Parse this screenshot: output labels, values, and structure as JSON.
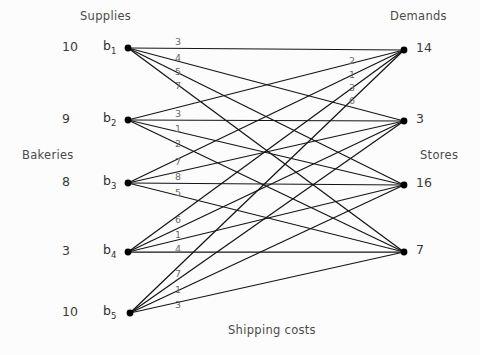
{
  "labels": {
    "supplies": "Supplies",
    "demands": "Demands",
    "bakeries": "Bakeries",
    "stores": "Stores",
    "caption": "Shipping costs"
  },
  "bakeries": [
    {
      "name": "b",
      "index": "1",
      "supply": "10",
      "x": 128,
      "y": 48
    },
    {
      "name": "b",
      "index": "2",
      "supply": "9",
      "x": 128,
      "y": 120
    },
    {
      "name": "b",
      "index": "3",
      "supply": "8",
      "x": 128,
      "y": 183
    },
    {
      "name": "b",
      "index": "4",
      "supply": "3",
      "x": 128,
      "y": 252
    },
    {
      "name": "b",
      "index": "5",
      "supply": "10",
      "x": 130,
      "y": 313
    }
  ],
  "stores": [
    {
      "demand": "14",
      "x": 404,
      "y": 50
    },
    {
      "demand": "3",
      "x": 404,
      "y": 121
    },
    {
      "demand": "16",
      "x": 404,
      "y": 185
    },
    {
      "demand": "7",
      "x": 404,
      "y": 252
    }
  ],
  "chart_data": {
    "type": "diagram",
    "title": "Shipping costs",
    "subtype": "bipartite-transportation-network",
    "left_axis_label": "Bakeries",
    "right_axis_label": "Stores",
    "left_value_header": "Supplies",
    "right_value_header": "Demands",
    "left_nodes": [
      "b1",
      "b2",
      "b3",
      "b4",
      "b5"
    ],
    "right_nodes": [
      "s1",
      "s2",
      "s3",
      "s4"
    ],
    "supplies": [
      10,
      9,
      8,
      3,
      10
    ],
    "demands": [
      14,
      3,
      16,
      7
    ],
    "cost_matrix": [
      [
        3,
        4,
        5,
        7
      ],
      [
        3,
        1,
        2,
        null
      ],
      [
        7,
        8,
        5,
        null
      ],
      [
        6,
        1,
        4,
        null
      ],
      [
        7,
        1,
        3,
        null
      ]
    ],
    "visible_cost_labels_left": [
      {
        "node": "b1",
        "values": [
          "3",
          "4",
          "5",
          "7"
        ]
      },
      {
        "node": "b2",
        "values": [
          "3",
          "1",
          "2"
        ]
      },
      {
        "node": "b3",
        "values": [
          "7",
          "8",
          "5"
        ]
      },
      {
        "node": "b4",
        "values": [
          "6",
          "1",
          "4"
        ]
      },
      {
        "node": "b5",
        "values": [
          "7",
          "1",
          "3"
        ]
      }
    ],
    "visible_cost_labels_right": [
      {
        "node": "s1",
        "values": [
          "2",
          "1",
          "3",
          "6"
        ]
      }
    ],
    "edge_count": 20,
    "complete_bipartite": true
  },
  "edge_labels_left": [
    {
      "text": "3",
      "x": 178,
      "y": 45
    },
    {
      "text": "4",
      "x": 178,
      "y": 61
    },
    {
      "text": "5",
      "x": 178,
      "y": 75
    },
    {
      "text": "7",
      "x": 178,
      "y": 89
    },
    {
      "text": "3",
      "x": 178,
      "y": 117
    },
    {
      "text": "1",
      "x": 178,
      "y": 132
    },
    {
      "text": "2",
      "x": 178,
      "y": 147
    },
    {
      "text": "7",
      "x": 178,
      "y": 165
    },
    {
      "text": "8",
      "x": 178,
      "y": 180
    },
    {
      "text": "5",
      "x": 178,
      "y": 196
    },
    {
      "text": "6",
      "x": 178,
      "y": 223
    },
    {
      "text": "1",
      "x": 178,
      "y": 238
    },
    {
      "text": "4",
      "x": 178,
      "y": 252
    },
    {
      "text": "7",
      "x": 178,
      "y": 277
    },
    {
      "text": "1",
      "x": 178,
      "y": 293
    },
    {
      "text": "3",
      "x": 178,
      "y": 308
    }
  ],
  "edge_labels_right": [
    {
      "text": "2",
      "x": 352,
      "y": 64
    },
    {
      "text": "1",
      "x": 352,
      "y": 78
    },
    {
      "text": "3",
      "x": 352,
      "y": 91
    },
    {
      "text": "6",
      "x": 352,
      "y": 104
    }
  ],
  "positions": {
    "supplies_label": {
      "x": 80,
      "y": 11
    },
    "demands_label": {
      "x": 390,
      "y": 11
    },
    "bakeries_label": {
      "x": 22,
      "y": 150
    },
    "stores_label": {
      "x": 420,
      "y": 150
    },
    "caption": {
      "x": 228,
      "y": 325
    }
  },
  "colors": {
    "edge": "#151515",
    "node": "#000000",
    "text": "#3a3a3a",
    "cost_text": "#6b6b6b",
    "background": "#fcfcfc"
  }
}
